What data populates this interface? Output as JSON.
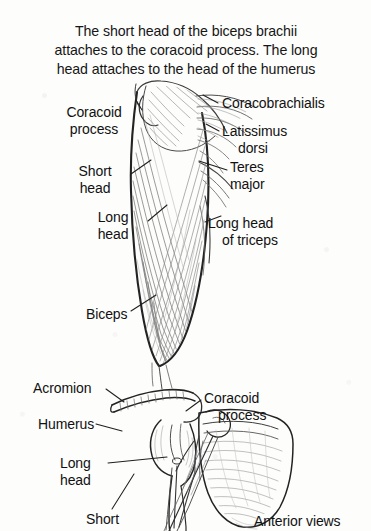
{
  "figure": {
    "caption_lines": [
      "The short head of the biceps brachii",
      "attaches to the coracoid process. The long",
      "head attaches to the head of the humerus"
    ],
    "footer_note": "Anterior views"
  },
  "upper_figure": {
    "name": "anterior-view-upper-arm",
    "labels": {
      "coracoid_process": [
        "Coracoid",
        "process"
      ],
      "short_head": [
        "Short",
        "head"
      ],
      "long_head": [
        "Long",
        "head"
      ],
      "biceps": [
        "Biceps"
      ],
      "coracobrachialis": [
        "Coracobrachialis"
      ],
      "latissimus_dorsi": [
        "Latissimus",
        "dorsi"
      ],
      "teres_major": [
        "Teres",
        "major"
      ],
      "long_head_of_triceps": [
        "Long head",
        "of triceps"
      ]
    }
  },
  "lower_figure": {
    "name": "anterior-view-shoulder-scapula",
    "labels": {
      "acromion": [
        "Acromion"
      ],
      "humerus": [
        "Humerus"
      ],
      "long_head": [
        "Long",
        "head"
      ],
      "short": [
        "Short"
      ],
      "coracoid_process": [
        "Coracoid",
        "process"
      ]
    }
  },
  "style": {
    "ink": "#1a1a1a",
    "background": "#fdfdfc",
    "muscle_tone": "#8d8d8d"
  }
}
